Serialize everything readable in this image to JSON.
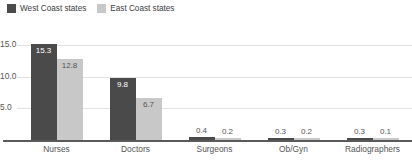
{
  "chart_data": {
    "type": "bar",
    "title": "",
    "xlabel": "",
    "ylabel": "",
    "categories": [
      "Nurses",
      "Doctors",
      "Surgeons",
      "Ob/Gyn",
      "Radiographers"
    ],
    "series": [
      {
        "name": "West Coast states",
        "color": "#4a4a4a",
        "values": [
          15.3,
          9.8,
          0.4,
          0.3,
          0.3
        ],
        "value_labels": [
          "15.3",
          "9.8",
          "0.4",
          "0.3",
          "0.3"
        ]
      },
      {
        "name": "East Coast states",
        "color": "#c8c8c8",
        "values": [
          12.8,
          6.7,
          0.2,
          0.2,
          0.1
        ],
        "value_labels": [
          "12.8",
          "6.7",
          "0.2",
          "0.2",
          "0.1"
        ]
      }
    ],
    "ylim": [
      0,
      16.5
    ],
    "yticks": [
      5.0,
      10.0,
      15.0
    ],
    "ytick_labels": [
      "5.0",
      "10.0",
      "15.0"
    ],
    "grid": true,
    "legend_position": "top-left",
    "axis_color": "#5a5a5a",
    "gridline_color": "#e2e2e2",
    "tick_label_color": "#555555"
  }
}
